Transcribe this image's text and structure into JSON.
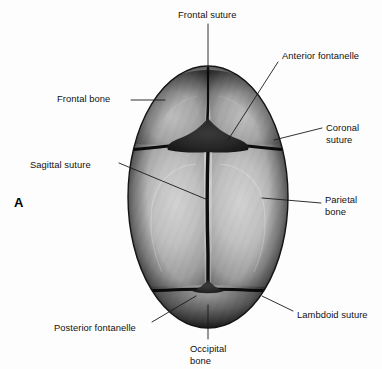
{
  "figure": {
    "panel_letter": "A",
    "view": "superior view of neonatal skull",
    "background_color": "#fdfdfd"
  },
  "labels": [
    {
      "id": "frontal-suture",
      "text": "Frontal suture",
      "x": 178,
      "y": 9,
      "align": "left"
    },
    {
      "id": "anterior-fontanelle",
      "text": "Anterior fontanelle",
      "x": 282,
      "y": 50,
      "align": "left"
    },
    {
      "id": "frontal-bone",
      "text": "Frontal bone",
      "x": 57,
      "y": 93,
      "align": "left"
    },
    {
      "id": "coronal-suture",
      "text": "Coronal\nsuture",
      "x": 326,
      "y": 122,
      "align": "left"
    },
    {
      "id": "sagittal-suture",
      "text": "Sagittal suture",
      "x": 30,
      "y": 159,
      "align": "left"
    },
    {
      "id": "parietal-bone",
      "text": "Parietal\nbone",
      "x": 325,
      "y": 194,
      "align": "left"
    },
    {
      "id": "lambdoid-suture",
      "text": "Lambdoid suture",
      "x": 297,
      "y": 309,
      "align": "left"
    },
    {
      "id": "posterior-fontanelle",
      "text": "Posterior fontanelle",
      "x": 54,
      "y": 322,
      "align": "left"
    },
    {
      "id": "occipital-bone",
      "text": "Occipital\nbone",
      "x": 190,
      "y": 343,
      "align": "left"
    }
  ],
  "anatomy": {
    "bones": [
      {
        "id": "frontal-bone-left",
        "name": "Frontal bone (left)"
      },
      {
        "id": "frontal-bone-right",
        "name": "Frontal bone (right)"
      },
      {
        "id": "parietal-bone-left",
        "name": "Parietal bone (left)"
      },
      {
        "id": "parietal-bone-right",
        "name": "Parietal bone (right)"
      },
      {
        "id": "occipital-bone",
        "name": "Occipital bone"
      }
    ],
    "sutures": [
      {
        "id": "frontal-suture",
        "name": "Frontal suture"
      },
      {
        "id": "coronal-suture",
        "name": "Coronal suture"
      },
      {
        "id": "sagittal-suture",
        "name": "Sagittal suture"
      },
      {
        "id": "lambdoid-suture",
        "name": "Lambdoid suture"
      }
    ],
    "fontanelles": [
      {
        "id": "anterior-fontanelle",
        "name": "Anterior fontanelle"
      },
      {
        "id": "posterior-fontanelle",
        "name": "Posterior fontanelle"
      }
    ]
  },
  "colors": {
    "bone_light": "#c9c9c9",
    "bone_mid": "#9a9a9a",
    "bone_dark": "#4a4a4a",
    "suture_dark": "#0d0d0d",
    "fontanelle": "#2a2a2a",
    "leader_line": "#1a1a1a",
    "label_text": "#111111"
  }
}
